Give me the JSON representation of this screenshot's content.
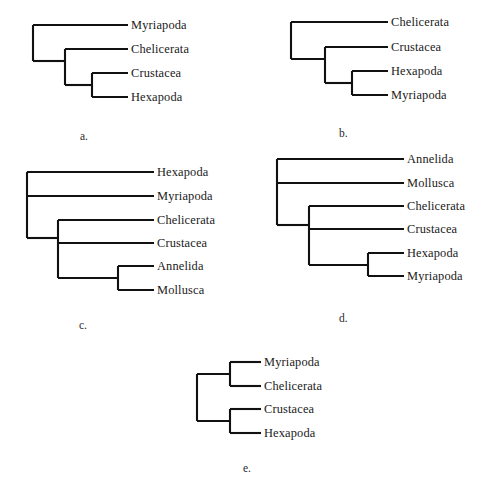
{
  "figure": {
    "width": 493,
    "height": 503,
    "background": "#ffffff",
    "line_color": "#111111",
    "text_color": "#1a1a1a"
  },
  "panels": [
    {
      "id": "a",
      "caption": "a.",
      "caption_x": 80,
      "caption_y": 131,
      "origin_x": 0,
      "origin_y": 0,
      "label_x": 131,
      "tips": [
        {
          "name": "Myriapoda",
          "y": 25
        },
        {
          "name": "Chelicerata",
          "y": 49
        },
        {
          "name": "Crustacea",
          "y": 73
        },
        {
          "name": "Hexapoda",
          "y": 97
        }
      ],
      "tip_end_x": 128,
      "nodes": [
        {
          "name": "root",
          "x": 33,
          "y_top": 25,
          "y_bottom": 61
        },
        {
          "name": "node-chelicerata-crustacea-hexapoda",
          "x": 65,
          "y_top": 49,
          "y_bottom": 85
        },
        {
          "name": "node-crustacea-hexapoda",
          "x": 92,
          "y_top": 73,
          "y_bottom": 97
        }
      ],
      "horizontals": [
        {
          "name": "branch-myriapoda",
          "x1": 33,
          "x2": 128,
          "y": 25
        },
        {
          "name": "branch-to-node-b",
          "x1": 33,
          "x2": 65,
          "y": 61
        },
        {
          "name": "branch-chelicerata",
          "x1": 65,
          "x2": 128,
          "y": 49
        },
        {
          "name": "branch-to-node-c",
          "x1": 65,
          "x2": 92,
          "y": 85
        },
        {
          "name": "branch-crustacea",
          "x1": 92,
          "x2": 128,
          "y": 73
        },
        {
          "name": "branch-hexapoda",
          "x1": 92,
          "x2": 128,
          "y": 97
        }
      ]
    },
    {
      "id": "b",
      "caption": "b.",
      "caption_x": 339,
      "caption_y": 128,
      "origin_x": 0,
      "origin_y": 0,
      "label_x": 391,
      "tips": [
        {
          "name": "Chelicerata",
          "y": 22
        },
        {
          "name": "Crustacea",
          "y": 47
        },
        {
          "name": "Hexapoda",
          "y": 71
        },
        {
          "name": "Myriapoda",
          "y": 95
        }
      ],
      "tip_end_x": 388,
      "nodes": [
        {
          "name": "root",
          "x": 291,
          "y_top": 22,
          "y_bottom": 59
        },
        {
          "name": "node-crustacea-hexapoda-myriapoda",
          "x": 325,
          "y_top": 47,
          "y_bottom": 83
        },
        {
          "name": "node-hexapoda-myriapoda",
          "x": 352,
          "y_top": 71,
          "y_bottom": 95
        }
      ],
      "horizontals": [
        {
          "name": "branch-chelicerata",
          "x1": 291,
          "x2": 388,
          "y": 22
        },
        {
          "name": "branch-to-node-b",
          "x1": 291,
          "x2": 325,
          "y": 59
        },
        {
          "name": "branch-crustacea",
          "x1": 325,
          "x2": 388,
          "y": 47
        },
        {
          "name": "branch-to-node-c",
          "x1": 325,
          "x2": 352,
          "y": 83
        },
        {
          "name": "branch-hexapoda",
          "x1": 352,
          "x2": 388,
          "y": 71
        },
        {
          "name": "branch-myriapoda",
          "x1": 352,
          "x2": 388,
          "y": 95
        }
      ]
    },
    {
      "id": "c",
      "caption": "c.",
      "caption_x": 79,
      "caption_y": 320,
      "origin_x": 0,
      "origin_y": 0,
      "label_x": 157,
      "tips": [
        {
          "name": "Hexapoda",
          "y": 172
        },
        {
          "name": "Myriapoda",
          "y": 196
        },
        {
          "name": "Chelicerata",
          "y": 220
        },
        {
          "name": "Crustacea",
          "y": 243
        },
        {
          "name": "Annelida",
          "y": 266
        },
        {
          "name": "Mollusca",
          "y": 290
        }
      ],
      "tip_end_x": 154,
      "nodes": [
        {
          "name": "root",
          "x": 27,
          "y_top": 172,
          "y_bottom": 238
        },
        {
          "name": "node-inner",
          "x": 58,
          "y_top": 220,
          "y_bottom": 278
        },
        {
          "name": "node-annelida-mollusca",
          "x": 118,
          "y_top": 266,
          "y_bottom": 290
        }
      ],
      "horizontals": [
        {
          "name": "branch-hexapoda",
          "x1": 27,
          "x2": 154,
          "y": 172
        },
        {
          "name": "branch-myriapoda",
          "x1": 27,
          "x2": 154,
          "y": 196
        },
        {
          "name": "branch-to-inner",
          "x1": 27,
          "x2": 58,
          "y": 238
        },
        {
          "name": "branch-chelicerata",
          "x1": 58,
          "x2": 154,
          "y": 220
        },
        {
          "name": "branch-crustacea",
          "x1": 58,
          "x2": 154,
          "y": 243
        },
        {
          "name": "branch-to-annelida-mollusca",
          "x1": 58,
          "x2": 118,
          "y": 278
        },
        {
          "name": "branch-annelida",
          "x1": 118,
          "x2": 154,
          "y": 266
        },
        {
          "name": "branch-mollusca",
          "x1": 118,
          "x2": 154,
          "y": 290
        }
      ]
    },
    {
      "id": "d",
      "caption": "d.",
      "caption_x": 339,
      "caption_y": 313,
      "origin_x": 0,
      "origin_y": 0,
      "label_x": 407,
      "tips": [
        {
          "name": "Annelida",
          "y": 159
        },
        {
          "name": "Mollusca",
          "y": 183
        },
        {
          "name": "Chelicerata",
          "y": 206
        },
        {
          "name": "Crustacea",
          "y": 229
        },
        {
          "name": "Hexapoda",
          "y": 253
        },
        {
          "name": "Myriapoda",
          "y": 276
        }
      ],
      "tip_end_x": 404,
      "nodes": [
        {
          "name": "root",
          "x": 277,
          "y_top": 159,
          "y_bottom": 225
        },
        {
          "name": "node-inner",
          "x": 309,
          "y_top": 206,
          "y_bottom": 265
        },
        {
          "name": "node-hexapoda-myriapoda",
          "x": 368,
          "y_top": 253,
          "y_bottom": 276
        }
      ],
      "horizontals": [
        {
          "name": "branch-annelida",
          "x1": 277,
          "x2": 404,
          "y": 159
        },
        {
          "name": "branch-mollusca",
          "x1": 277,
          "x2": 404,
          "y": 183
        },
        {
          "name": "branch-to-inner",
          "x1": 277,
          "x2": 309,
          "y": 225
        },
        {
          "name": "branch-chelicerata",
          "x1": 309,
          "x2": 404,
          "y": 206
        },
        {
          "name": "branch-crustacea",
          "x1": 309,
          "x2": 404,
          "y": 229
        },
        {
          "name": "branch-to-hexapoda-myriapoda",
          "x1": 309,
          "x2": 368,
          "y": 265
        },
        {
          "name": "branch-hexapoda",
          "x1": 368,
          "x2": 404,
          "y": 253
        },
        {
          "name": "branch-myriapoda",
          "x1": 368,
          "x2": 404,
          "y": 276
        }
      ]
    },
    {
      "id": "e",
      "caption": "e.",
      "caption_x": 243,
      "caption_y": 463,
      "origin_x": 0,
      "origin_y": 0,
      "label_x": 264,
      "tips": [
        {
          "name": "Myriapoda",
          "y": 362
        },
        {
          "name": "Chelicerata",
          "y": 386
        },
        {
          "name": "Crustacea",
          "y": 409
        },
        {
          "name": "Hexapoda",
          "y": 433
        }
      ],
      "tip_end_x": 261,
      "nodes": [
        {
          "name": "root",
          "x": 197,
          "y_top": 374,
          "y_bottom": 421
        },
        {
          "name": "node-myriapoda-chelicerata",
          "x": 230,
          "y_top": 362,
          "y_bottom": 386
        },
        {
          "name": "node-crustacea-hexapoda",
          "x": 230,
          "y_top": 409,
          "y_bottom": 433
        }
      ],
      "horizontals": [
        {
          "name": "branch-to-upper-clade",
          "x1": 197,
          "x2": 230,
          "y": 374
        },
        {
          "name": "branch-to-lower-clade",
          "x1": 197,
          "x2": 230,
          "y": 421
        },
        {
          "name": "branch-myriapoda",
          "x1": 230,
          "x2": 261,
          "y": 362
        },
        {
          "name": "branch-chelicerata",
          "x1": 230,
          "x2": 261,
          "y": 386
        },
        {
          "name": "branch-crustacea",
          "x1": 230,
          "x2": 261,
          "y": 409
        },
        {
          "name": "branch-hexapoda",
          "x1": 230,
          "x2": 261,
          "y": 433
        }
      ]
    }
  ]
}
